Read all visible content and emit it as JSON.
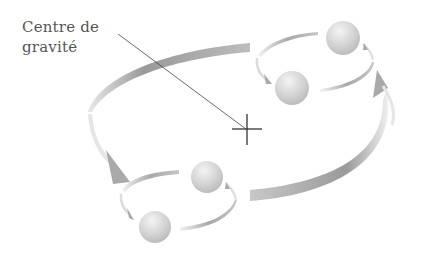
{
  "diagram": {
    "label_line1": "Centre de",
    "label_line2": "gravité",
    "colors": {
      "arc": "#9a9a9a",
      "arc_light": "#e2e2e2",
      "sphere": "#cfcfcf",
      "cross": "#333333",
      "leader": "#444444"
    },
    "elements": [
      "center-of-gravity-cross",
      "large-orbit-arrow",
      "upper-pair-orbit",
      "lower-pair-orbit"
    ]
  }
}
